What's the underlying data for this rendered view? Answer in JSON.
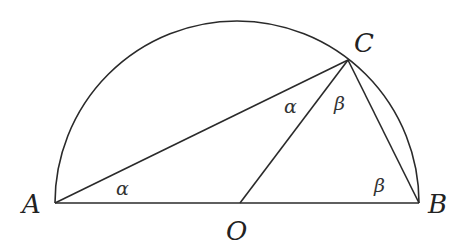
{
  "diagram": {
    "type": "geometry",
    "points": {
      "A": {
        "label": "A",
        "x": 55,
        "y": 203
      },
      "B": {
        "label": "B",
        "x": 419,
        "y": 203
      },
      "O": {
        "label": "O",
        "x": 240,
        "y": 203
      },
      "C": {
        "label": "C",
        "x": 348,
        "y": 60
      }
    },
    "segments": [
      {
        "from": "A",
        "to": "B"
      },
      {
        "from": "A",
        "to": "C"
      },
      {
        "from": "O",
        "to": "C"
      },
      {
        "from": "C",
        "to": "B"
      }
    ],
    "arc": {
      "center": "O",
      "radius": 182,
      "span": "semicircle above AB"
    },
    "angle_labels": [
      {
        "text": "α",
        "at": "A",
        "between": [
          "AB",
          "AC"
        ]
      },
      {
        "text": "α",
        "at": "C",
        "between": [
          "CA",
          "CO"
        ]
      },
      {
        "text": "β",
        "at": "C",
        "between": [
          "CO",
          "CB"
        ]
      },
      {
        "text": "β",
        "at": "B",
        "between": [
          "BA",
          "BC"
        ]
      }
    ],
    "labels": {
      "A": "A",
      "B": "B",
      "O": "O",
      "C": "C",
      "alpha_A": "α",
      "alpha_C": "α",
      "beta_C": "β",
      "beta_B": "β"
    }
  }
}
